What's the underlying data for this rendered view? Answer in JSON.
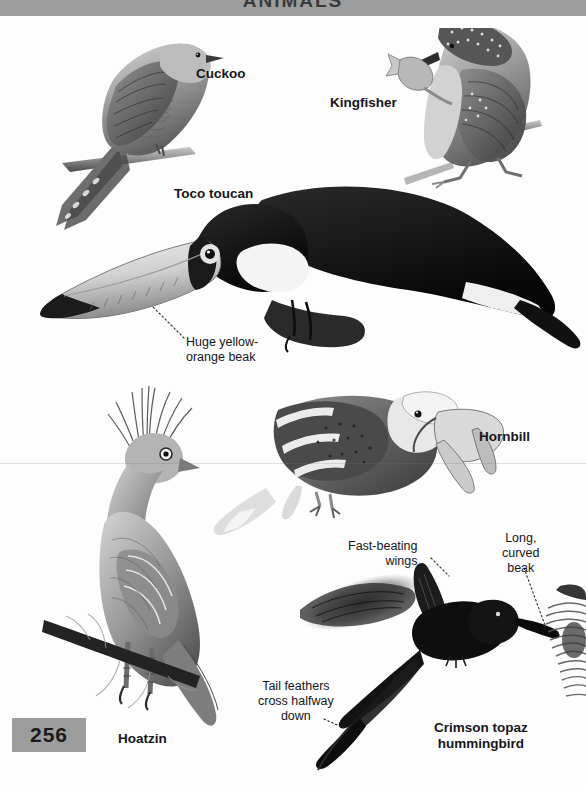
{
  "page": {
    "header_title": "ANIMALS",
    "number": "256",
    "band_color": "#9d9d9d",
    "background_color": "#fdfdfd",
    "text_color": "#15151a"
  },
  "species": [
    {
      "id": "cuckoo",
      "label": "Cuckoo"
    },
    {
      "id": "kingfisher",
      "label": "Kingfisher"
    },
    {
      "id": "toucan",
      "label": "Toco toucan"
    },
    {
      "id": "hornbill",
      "label": "Hornbill"
    },
    {
      "id": "hoatzin",
      "label": "Hoatzin"
    },
    {
      "id": "hummingbird",
      "label": "Crimson topaz\nhummingbird"
    }
  ],
  "annotations": [
    {
      "id": "toucan-beak",
      "text": "Huge yellow-\norange beak"
    },
    {
      "id": "wings",
      "text": "Fast-beating\nwings"
    },
    {
      "id": "long-beak",
      "text": "Long,\ncurved\nbeak"
    },
    {
      "id": "tail",
      "text": "Tail feathers\ncross halfway\ndown"
    }
  ]
}
